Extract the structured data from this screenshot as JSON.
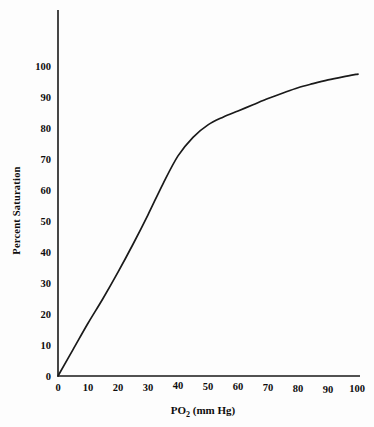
{
  "chart_data": {
    "type": "line",
    "title": "",
    "subtitle": "",
    "xlabel": "PO2 (mm Hg)",
    "xlabel_main": "PO",
    "xlabel_sub": "2",
    "xlabel_tail": "(mm Hg)",
    "ylabel": "Percent Saturation",
    "xlim": [
      0,
      100
    ],
    "ylim": [
      0,
      100
    ],
    "xticks": [
      "0",
      "10",
      "20",
      "30",
      "40",
      "50",
      "60",
      "70",
      "80",
      "90",
      "100"
    ],
    "yticks": [
      "0",
      "10",
      "20",
      "30",
      "40",
      "50",
      "60",
      "70",
      "80",
      "90",
      "100"
    ],
    "grid": false,
    "legend": "none",
    "line_color": "#1a1a1a",
    "background_color": "#fdfdfd",
    "series": [
      {
        "name": "Oxygen-hemoglobin dissociation curve",
        "x": [
          0,
          5,
          10,
          15,
          20,
          25,
          30,
          35,
          40,
          45,
          50,
          55,
          60,
          65,
          70,
          75,
          80,
          85,
          90,
          95,
          100
        ],
        "values": [
          0,
          8.5,
          17,
          25,
          33.5,
          42.5,
          52,
          62,
          71,
          77,
          81,
          83.5,
          85.5,
          87.5,
          89.5,
          91.3,
          93,
          94.3,
          95.5,
          96.5,
          97.4
        ]
      }
    ]
  },
  "figure": {
    "caption": ""
  }
}
